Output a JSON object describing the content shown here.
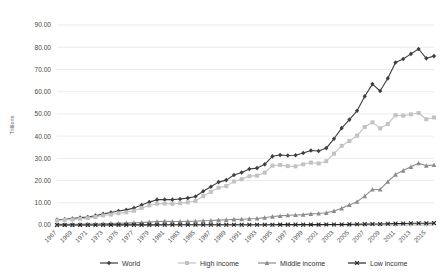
{
  "chart_data": {
    "type": "line",
    "title": "",
    "xlabel": "",
    "ylabel": "Trillions",
    "ylim": [
      0,
      90
    ],
    "ytick_step": 10,
    "ytick_labels": [
      "0.00",
      "10.00",
      "20.00",
      "30.00",
      "40.00",
      "50.00",
      "60.00",
      "70.00",
      "80.00",
      "90.00"
    ],
    "grid": true,
    "legend_position": "bottom",
    "x": [
      1967,
      1968,
      1969,
      1970,
      1971,
      1972,
      1973,
      1974,
      1975,
      1976,
      1977,
      1978,
      1979,
      1980,
      1981,
      1982,
      1983,
      1984,
      1985,
      1986,
      1987,
      1988,
      1989,
      1990,
      1991,
      1992,
      1993,
      1994,
      1995,
      1996,
      1997,
      1998,
      1999,
      2000,
      2001,
      2002,
      2003,
      2004,
      2005,
      2006,
      2007,
      2008,
      2009,
      2010,
      2011,
      2012,
      2013,
      2014,
      2015,
      2016
    ],
    "xtick_labels": [
      "1967",
      "1969",
      "1971",
      "1973",
      "1975",
      "1977",
      "1979",
      "1981",
      "1983",
      "1985",
      "1987",
      "1989",
      "1991",
      "1993",
      "1995",
      "1997",
      "1999",
      "2001",
      "2003",
      "2005",
      "2007",
      "2009",
      "2011",
      "2013",
      "2015"
    ],
    "series": [
      {
        "name": "World",
        "color": "#3f3f3f",
        "marker": "diamond",
        "values": [
          2.4,
          2.6,
          2.9,
          3.3,
          3.6,
          4.2,
          5.0,
          5.6,
          6.3,
          6.8,
          7.6,
          9.0,
          10.3,
          11.4,
          11.5,
          11.4,
          11.7,
          12.1,
          12.8,
          15.2,
          17.2,
          19.3,
          20.2,
          22.5,
          23.6,
          25.2,
          25.6,
          27.3,
          30.9,
          31.5,
          31.3,
          31.4,
          32.4,
          33.5,
          33.3,
          34.6,
          38.8,
          43.6,
          47.4,
          51.4,
          57.9,
          63.4,
          60.3,
          66.0,
          73.1,
          74.7,
          77.0,
          79.2,
          75.0,
          76.0
        ]
      },
      {
        "name": "High income",
        "color": "#c2c2c2",
        "marker": "square",
        "values": [
          2.1,
          2.3,
          2.5,
          2.8,
          3.1,
          3.6,
          4.3,
          4.7,
          5.3,
          5.7,
          6.4,
          7.7,
          8.8,
          9.6,
          9.6,
          9.5,
          9.8,
          10.2,
          10.8,
          13.0,
          14.9,
          16.8,
          17.5,
          19.6,
          20.6,
          22.0,
          22.2,
          23.6,
          26.7,
          27.0,
          26.5,
          26.4,
          27.3,
          28.1,
          27.7,
          28.7,
          32.1,
          35.6,
          37.8,
          40.2,
          44.1,
          46.2,
          43.5,
          45.5,
          49.4,
          49.2,
          49.8,
          50.4,
          47.6,
          48.4
        ]
      },
      {
        "name": "Middle income",
        "color": "#8c8c8c",
        "marker": "triangle",
        "values": [
          0.26,
          0.28,
          0.31,
          0.35,
          0.4,
          0.46,
          0.57,
          0.7,
          0.8,
          0.86,
          0.97,
          1.1,
          1.3,
          1.55,
          1.65,
          1.6,
          1.6,
          1.65,
          1.7,
          1.9,
          2.0,
          2.2,
          2.35,
          2.55,
          2.6,
          2.8,
          2.95,
          3.3,
          3.8,
          4.1,
          4.4,
          4.5,
          4.65,
          5.0,
          5.2,
          5.5,
          6.3,
          7.5,
          9.0,
          10.5,
          13.0,
          16.0,
          16.0,
          19.5,
          22.7,
          24.5,
          26.2,
          27.8,
          26.7,
          27.0
        ]
      },
      {
        "name": "Low income",
        "color": "#262626",
        "marker": "x",
        "values": [
          0.018,
          0.019,
          0.021,
          0.023,
          0.025,
          0.028,
          0.033,
          0.039,
          0.044,
          0.046,
          0.052,
          0.06,
          0.068,
          0.078,
          0.082,
          0.082,
          0.08,
          0.08,
          0.082,
          0.087,
          0.095,
          0.105,
          0.11,
          0.118,
          0.12,
          0.125,
          0.125,
          0.13,
          0.145,
          0.155,
          0.16,
          0.165,
          0.172,
          0.18,
          0.185,
          0.195,
          0.22,
          0.255,
          0.29,
          0.33,
          0.39,
          0.46,
          0.47,
          0.53,
          0.62,
          0.69,
          0.76,
          0.82,
          0.82,
          0.85
        ]
      }
    ]
  },
  "legend": {
    "items": [
      {
        "label": "World"
      },
      {
        "label": "High income"
      },
      {
        "label": "Middle income"
      },
      {
        "label": "Low income"
      }
    ]
  }
}
